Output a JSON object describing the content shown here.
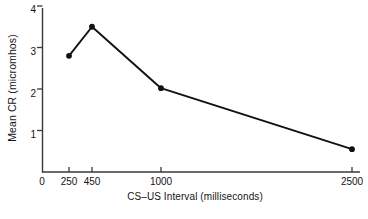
{
  "chart_data": {
    "type": "line",
    "title": "",
    "xlabel": "CS–US Interval (milliseconds)",
    "ylabel": "Mean CR (micromhos)",
    "x": [
      250,
      450,
      1000,
      2500
    ],
    "values": [
      2.8,
      3.5,
      2.02,
      0.55
    ],
    "series": [
      {
        "name": "Mean CR",
        "values": [
          2.8,
          3.5,
          2.02,
          0.55
        ]
      }
    ],
    "xtick_labels": [
      "0",
      "250",
      "450",
      "1000",
      "2500"
    ],
    "xtick_values": [
      0,
      250,
      450,
      1000,
      2500
    ],
    "ytick_labels": [
      "1",
      "2",
      "3",
      "4"
    ],
    "ytick_values": [
      1,
      2,
      3,
      4
    ],
    "ylim": [
      0,
      4.25
    ],
    "grid": false,
    "legend": false,
    "legend_position": "none",
    "marker": "filled-circle",
    "line_color": "#111111",
    "marker_color": "#111111",
    "background_color": "#ffffff",
    "axis_color": "#3a3a3a",
    "annotations": []
  },
  "axis": {
    "y_label": "Mean CR (micromhos)",
    "x_label": "CS–US Interval (milliseconds)",
    "y_ticks": [
      {
        "label": "4",
        "value": 4
      },
      {
        "label": "3",
        "value": 3
      },
      {
        "label": "2",
        "value": 2
      },
      {
        "label": "1",
        "value": 1
      }
    ],
    "x_ticks": [
      {
        "label": "0",
        "value": 0
      },
      {
        "label": "250",
        "value": 250
      },
      {
        "label": "450",
        "value": 450
      },
      {
        "label": "1000",
        "value": 1000
      },
      {
        "label": "2500",
        "value": 2500
      }
    ]
  },
  "footer": {
    "caption_fragment": ""
  }
}
